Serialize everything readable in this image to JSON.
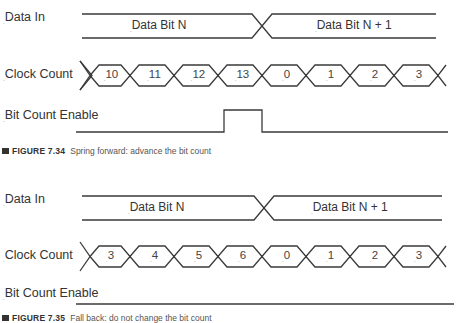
{
  "figures": [
    {
      "signals": {
        "data_in": "Data In",
        "clock_count": "Clock Count",
        "bit_count_enable": "Bit Count Enable"
      },
      "data_bus": [
        "Data Bit N",
        "Data Bit N + 1"
      ],
      "clock_values": [
        "10",
        "11",
        "12",
        "13",
        "0",
        "1",
        "2",
        "3"
      ],
      "bit_count_enable": "pulse high during clock count 13",
      "caption_number": "FIGURE 7.34",
      "caption_text": "Spring forward: advance the bit count"
    },
    {
      "signals": {
        "data_in": "Data In",
        "clock_count": "Clock Count",
        "bit_count_enable": "Bit Count Enable"
      },
      "data_bus": [
        "Data Bit N",
        "Data Bit N + 1"
      ],
      "clock_values": [
        "3",
        "4",
        "5",
        "6",
        "0",
        "1",
        "2",
        "3"
      ],
      "bit_count_enable": "stays low",
      "caption_number": "FIGURE 7.35",
      "caption_text": "Fall back: do not change the bit count"
    }
  ],
  "colors": {
    "line": "#3a3a3a",
    "text": "#333333",
    "caption": "#555555"
  }
}
